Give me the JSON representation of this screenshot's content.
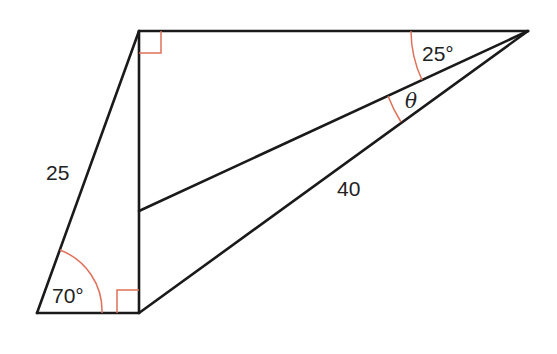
{
  "diagram": {
    "type": "geometry-figure",
    "colors": {
      "line": "#1a1a1a",
      "angle_mark": "#e0705a",
      "text": "#222222"
    },
    "labels": {
      "side_left": "25",
      "side_hypotenuse": "40",
      "angle_bottom_left": "70°",
      "angle_top_right": "25°",
      "angle_unknown": "θ"
    },
    "right_angles": [
      "top-left vertex",
      "bottom vertex"
    ],
    "given": {
      "slanted_side_length": 25,
      "long_diagonal_length": 40,
      "bottom_left_angle_deg": 70,
      "top_right_angle_deg": 25,
      "unknown_angle": "θ"
    }
  }
}
